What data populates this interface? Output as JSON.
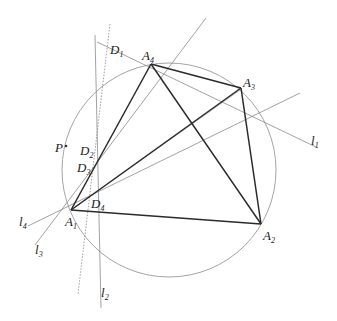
{
  "colors": {
    "background": "#ffffff",
    "edge": "#2a2a2a",
    "thin": "#8a8a8a",
    "circle": "#9a9a9a",
    "text": "#222222"
  },
  "circle": {
    "cx": 169,
    "cy": 170,
    "r": 107
  },
  "points": {
    "A1": {
      "x": 71,
      "y": 210,
      "name": "A",
      "sub": "1"
    },
    "A2": {
      "x": 261,
      "y": 224,
      "name": "A",
      "sub": "2"
    },
    "A3": {
      "x": 241,
      "y": 88,
      "name": "A",
      "sub": "3"
    },
    "A4": {
      "x": 151,
      "y": 64,
      "name": "A",
      "sub": "4"
    },
    "P": {
      "x": 66,
      "y": 146,
      "name": "P",
      "sub": ""
    }
  },
  "labels": [
    {
      "id": "A1",
      "name": "A",
      "sub": "1",
      "x": 65,
      "y": 226
    },
    {
      "id": "A2",
      "name": "A",
      "sub": "2",
      "x": 263,
      "y": 240
    },
    {
      "id": "A3",
      "name": "A",
      "sub": "3",
      "x": 243,
      "y": 87
    },
    {
      "id": "A4",
      "name": "A",
      "sub": "4",
      "x": 142,
      "y": 60
    },
    {
      "id": "D1",
      "name": "D",
      "sub": "1",
      "x": 110,
      "y": 54
    },
    {
      "id": "D2",
      "name": "D",
      "sub": "2",
      "x": 80,
      "y": 155
    },
    {
      "id": "D3",
      "name": "D",
      "sub": "3",
      "x": 77,
      "y": 172
    },
    {
      "id": "D4",
      "name": "D",
      "sub": "4",
      "x": 91,
      "y": 208
    },
    {
      "id": "P",
      "name": "P",
      "sub": "",
      "x": 55,
      "y": 152
    },
    {
      "id": "l1",
      "name": "l",
      "sub": "1",
      "x": 311,
      "y": 145
    },
    {
      "id": "l2",
      "name": "l",
      "sub": "2",
      "x": 101,
      "y": 297
    },
    {
      "id": "l3",
      "name": "l",
      "sub": "3",
      "x": 35,
      "y": 254
    },
    {
      "id": "l4",
      "name": "l",
      "sub": "4",
      "x": 19,
      "y": 226
    }
  ],
  "edges": [
    [
      "A1",
      "A4"
    ],
    [
      "A4",
      "A3"
    ],
    [
      "A3",
      "A2"
    ],
    [
      "A2",
      "A1"
    ],
    [
      "A4",
      "A2"
    ],
    [
      "A1",
      "A3"
    ]
  ],
  "lines": {
    "l1": {
      "x1": 97,
      "y1": 42,
      "x2": 318,
      "y2": 148
    },
    "l2": {
      "x1": 95,
      "y1": 35,
      "x2": 101,
      "y2": 308
    },
    "l3": {
      "x1": 35,
      "y1": 245,
      "x2": 206,
      "y2": 18
    },
    "l4": {
      "x1": 28,
      "y1": 226,
      "x2": 300,
      "y2": 93
    },
    "dotted": {
      "x1": 110,
      "y1": 24,
      "x2": 78,
      "y2": 294
    },
    "a1_thin": {
      "x1": 71,
      "y1": 210,
      "x2": 240,
      "y2": 90
    }
  }
}
